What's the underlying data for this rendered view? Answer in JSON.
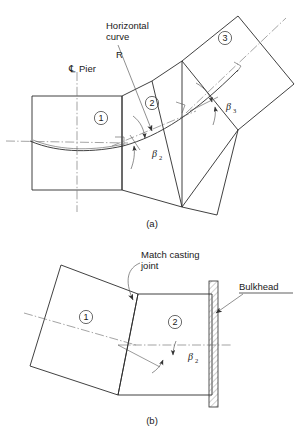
{
  "figure": {
    "title_context": "Precast segment geometry on horizontal curve",
    "line_color": "#2b2b2b",
    "centerline_color": "#666666",
    "background": "#ffffff"
  },
  "panel_a": {
    "caption": "(a)",
    "labels": {
      "pier_centerline": "Pier",
      "centerline_symbol": "℄",
      "horizontal_curve_line1": "Horizontal",
      "horizontal_curve_line2": "curve",
      "radius": "R"
    },
    "segments": [
      {
        "id": "1",
        "number": "①"
      },
      {
        "id": "2",
        "number": "②"
      },
      {
        "id": "3",
        "number": "③"
      }
    ],
    "angles": [
      {
        "name": "beta2",
        "symbol": "β",
        "subscript": "2"
      },
      {
        "name": "beta3",
        "symbol": "β",
        "subscript": "3"
      }
    ]
  },
  "panel_b": {
    "caption": "(b)",
    "labels": {
      "match_casting_line1": "Match casting",
      "match_casting_line2": "joint",
      "bulkhead": "Bulkhead"
    },
    "segments": [
      {
        "id": "1",
        "number": "①"
      },
      {
        "id": "2",
        "number": "②"
      }
    ],
    "angles": [
      {
        "name": "beta2",
        "symbol": "β",
        "subscript": "2"
      }
    ]
  }
}
